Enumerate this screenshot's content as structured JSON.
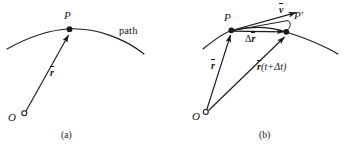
{
  "figure": {
    "kind": "physics-diagram",
    "background_color": "#ffffff",
    "stroke_color": "#1a1a1a",
    "width": 345,
    "height": 158,
    "panels": [
      {
        "id": "a",
        "caption": "(a)",
        "labels": {
          "point_p": "P",
          "path": "path",
          "vector_r": "r",
          "origin": "O"
        }
      },
      {
        "id": "b",
        "caption": "(b)",
        "labels": {
          "point_p": "P",
          "point_p_prime": "P′",
          "velocity": "v",
          "delta_r": "Δr",
          "delta_r_delta": "Δ",
          "delta_r_symbol": "r",
          "vector_r": "r",
          "r_t_delta_t_main": "r",
          "r_t_delta_t_args": "(t+Δt)",
          "origin": "O"
        }
      }
    ]
  }
}
